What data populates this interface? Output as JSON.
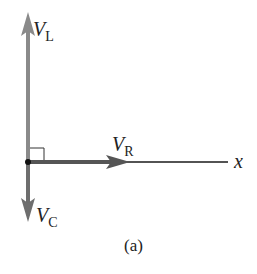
{
  "diagram": {
    "type": "phasor-diagram",
    "caption": "(a)",
    "axis_label": "x",
    "phasors": [
      {
        "name": "V",
        "subscript": "L",
        "direction": "up",
        "color": "#8a8a8a"
      },
      {
        "name": "V",
        "subscript": "R",
        "direction": "right",
        "color": "#555555"
      },
      {
        "name": "V",
        "subscript": "C",
        "direction": "down",
        "color": "#6e6e6e"
      }
    ],
    "annotations": [
      "right-angle marker at origin"
    ]
  }
}
